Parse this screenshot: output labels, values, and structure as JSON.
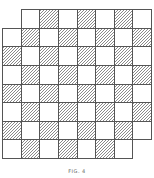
{
  "figure": {
    "caption": "FIG. 4",
    "rows": 8,
    "cols": 8,
    "shaded_rule": "row+col even",
    "removed_cells": [
      [
        0,
        0
      ],
      [
        7,
        7
      ]
    ],
    "colors": {
      "grid_line": "#555555",
      "hatch": "#8a8a8a",
      "background": "#ffffff"
    }
  }
}
